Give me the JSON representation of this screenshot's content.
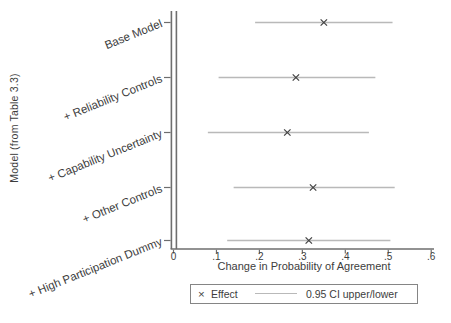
{
  "figure": {
    "background": "#ffffff"
  },
  "legend": {
    "marker_symbol": "×",
    "effect_label": "Effect",
    "ci_label": "0.95 CI upper/lower"
  },
  "chart_data": {
    "type": "scatter",
    "subtype": "coefficient-plot-with-ci",
    "categories": [
      "Base Model",
      "+ Reliability Controls",
      "+ Capability Uncertainty",
      "+ Other Controls",
      "+ High Participation Dummy"
    ],
    "series": [
      {
        "name": "Effect",
        "marker": "x",
        "values": [
          0.35,
          0.285,
          0.265,
          0.325,
          0.315
        ]
      },
      {
        "name": "0.95 CI upper/lower",
        "style": "interval-line",
        "lower": [
          0.19,
          0.105,
          0.08,
          0.14,
          0.125
        ],
        "upper": [
          0.51,
          0.47,
          0.455,
          0.515,
          0.505
        ]
      }
    ],
    "xlabel": "Change in Probability of Agreement",
    "ylabel": "Model (from Table 3.3)",
    "xlim": [
      0,
      0.6
    ],
    "xtick_values": [
      0,
      0.1,
      0.2,
      0.3,
      0.4,
      0.5,
      0.6
    ],
    "xtick_labels": [
      "0",
      ".1",
      ".2",
      ".3",
      ".4",
      ".5",
      ".6"
    ],
    "grid": false,
    "legend_position": "bottom"
  },
  "colors": {
    "ci_line": "#b9b9b9",
    "marker": "#424242",
    "axis": "#6e6e6e",
    "text": "#3d3d3d",
    "background": "#ffffff",
    "legend_border": "#858585"
  }
}
